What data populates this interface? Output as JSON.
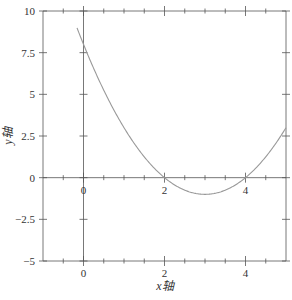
{
  "chart_data": {
    "type": "line",
    "title": "",
    "xlabel": "x轴",
    "ylabel": "y轴",
    "xlim": [
      -1,
      5
    ],
    "ylim": [
      -5,
      10
    ],
    "x_ticks": [
      0,
      2,
      4
    ],
    "x_tick_labels": [
      "0",
      "2",
      "4"
    ],
    "x_minor_step": 0.5,
    "y_ticks": [
      -5,
      -2.5,
      0,
      2.5,
      5,
      7.5,
      10
    ],
    "y_tick_labels": [
      "−5",
      "−2.5",
      "0",
      "2.5",
      "5",
      "7.5",
      "10"
    ],
    "grid": false,
    "center_axes": true,
    "legend": null,
    "series": [
      {
        "name": "f(x) = x² − 6x + 8",
        "x": [
          -0.16,
          0,
          0.5,
          1,
          1.5,
          2,
          2.5,
          3,
          3.5,
          4,
          4.5,
          5
        ],
        "values": [
          10,
          8,
          5.25,
          3,
          1.25,
          0,
          -0.75,
          -1,
          -0.75,
          0,
          1.25,
          3
        ]
      }
    ],
    "colors": {
      "curve": "#999999",
      "axes": "#555555",
      "text": "#333333"
    }
  }
}
